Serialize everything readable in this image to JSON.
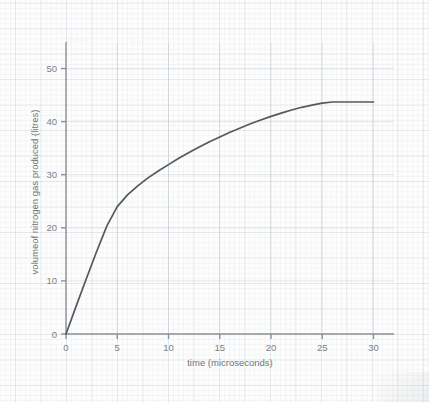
{
  "page": {
    "ghost_heading": "— —— ———",
    "ghost_subheading": "——————————————",
    "ghost_note_left": "volume",
    "ghost_note_right": "time"
  },
  "chart_data": {
    "type": "line",
    "title": "",
    "xlabel": "time (microseconds)",
    "ylabel": "volumeof nitrogen gas produced (litres)",
    "xlim": [
      0,
      32
    ],
    "ylim": [
      0,
      55
    ],
    "xticks": [
      0,
      5,
      10,
      15,
      20,
      25,
      30
    ],
    "yticks": [
      0,
      10,
      20,
      30,
      40,
      50
    ],
    "xtick_labels": [
      "0",
      "5",
      "10",
      "15",
      "20",
      "25",
      "30"
    ],
    "ytick_labels": [
      "0",
      "10",
      "20",
      "30",
      "40",
      "50"
    ],
    "grid": true,
    "legend": false,
    "line_color": "#55585c",
    "series": [
      {
        "name": "volume of nitrogen gas produced",
        "x": [
          0,
          1,
          2,
          3,
          4,
          5,
          6,
          7,
          8,
          9,
          10,
          11,
          12,
          13,
          14,
          15,
          16,
          17,
          18,
          19,
          20,
          21,
          22,
          23,
          24,
          25,
          26,
          27,
          28,
          29,
          30
        ],
        "y": [
          0,
          5.3,
          10.5,
          15.6,
          20.4,
          24.0,
          26.2,
          27.9,
          29.4,
          30.7,
          31.9,
          33.1,
          34.2,
          35.2,
          36.2,
          37.1,
          38.0,
          38.8,
          39.6,
          40.3,
          41.0,
          41.6,
          42.2,
          42.7,
          43.1,
          43.5,
          43.7,
          43.7,
          43.7,
          43.7,
          43.7
        ]
      }
    ],
    "annotations": [
      {
        "label": "plateau value",
        "value": 43.7
      },
      {
        "label": "gradient change at",
        "value": 5
      }
    ]
  }
}
